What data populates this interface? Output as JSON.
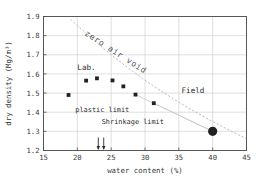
{
  "chart_data": {
    "type": "scatter",
    "title": "",
    "xlabel": "water content (%)",
    "ylabel": "dry density (Mg/m³)",
    "xlim": [
      15,
      45
    ],
    "ylim": [
      1.2,
      1.9
    ],
    "xticks": [
      "15",
      "20",
      "25",
      "30",
      "35",
      "40",
      "45"
    ],
    "yticks": [
      "1.2",
      "1.3",
      "1.4",
      "1.5",
      "1.6",
      "1.7",
      "1.8",
      "1.9"
    ],
    "grid": true,
    "legend_position": "inline-annotations",
    "series": [
      {
        "name": "Lab.",
        "marker": "filled-square",
        "color": "#222222",
        "points": [
          {
            "x": 18.7,
            "y": 1.49
          },
          {
            "x": 21.3,
            "y": 1.565
          },
          {
            "x": 22.9,
            "y": 1.577
          },
          {
            "x": 25.2,
            "y": 1.566
          },
          {
            "x": 26.8,
            "y": 1.535
          },
          {
            "x": 28.6,
            "y": 1.492
          },
          {
            "x": 31.3,
            "y": 1.447
          }
        ]
      },
      {
        "name": "Field",
        "marker": "filled-circle",
        "color": "#222222",
        "points": [
          {
            "x": 40.0,
            "y": 1.3
          }
        ]
      }
    ],
    "curves": [
      {
        "name": "zero air void",
        "style": "dashed",
        "color": "#bdbdbd",
        "points": [
          {
            "x": 19.0,
            "y": 1.885
          },
          {
            "x": 22.0,
            "y": 1.79
          },
          {
            "x": 25.0,
            "y": 1.7
          },
          {
            "x": 28.0,
            "y": 1.618
          },
          {
            "x": 31.0,
            "y": 1.543
          },
          {
            "x": 34.0,
            "y": 1.474
          },
          {
            "x": 37.0,
            "y": 1.41
          },
          {
            "x": 40.0,
            "y": 1.351
          },
          {
            "x": 43.0,
            "y": 1.296
          },
          {
            "x": 45.0,
            "y": 1.262
          }
        ]
      },
      {
        "name": "lab-to-field-connector-upper",
        "style": "solid-thin",
        "color": "#c8c8c8",
        "points": [
          {
            "x": 28.6,
            "y": 1.492
          },
          {
            "x": 40.0,
            "y": 1.3
          }
        ]
      },
      {
        "name": "lab-to-field-connector-lower",
        "style": "solid-thin",
        "color": "#c8c8c8",
        "points": [
          {
            "x": 31.3,
            "y": 1.447
          },
          {
            "x": 40.0,
            "y": 1.3
          }
        ]
      }
    ],
    "annotations": [
      {
        "name": "zero-air-void",
        "text": "zero air void",
        "x": 21.0,
        "y": 1.805,
        "rotation": 33
      },
      {
        "name": "lab",
        "text": "Lab.",
        "x": 20.0,
        "y": 1.62,
        "rotation": 0
      },
      {
        "name": "field",
        "text": "Field",
        "x": 35.4,
        "y": 1.5,
        "rotation": 0
      },
      {
        "name": "plastic-limit",
        "text": "plastic limit",
        "x": 19.7,
        "y": 1.402,
        "rotation": 0
      },
      {
        "name": "shrinkage-limit",
        "text": "Shrinkage limit",
        "x": 23.6,
        "y": 1.34,
        "rotation": 0
      }
    ],
    "limit_markers": [
      {
        "name": "shrinkage-limit-arrow",
        "x": 23.1
      },
      {
        "name": "plastic-limit-arrow",
        "x": 23.9
      }
    ]
  }
}
